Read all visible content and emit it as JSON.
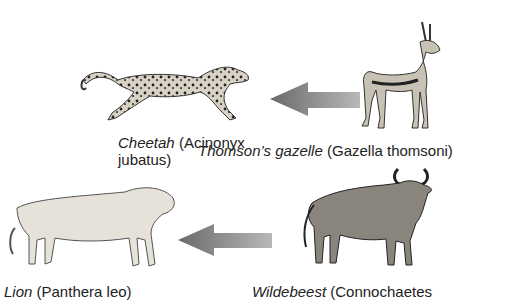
{
  "diagram": {
    "type": "food-chain",
    "arrow_color": "#7a7a7a",
    "rows": [
      {
        "predator": {
          "common": "Cheetah",
          "scientific_line1": "(Acinonyx",
          "scientific_line2": "jubatus)"
        },
        "prey": {
          "common": "Thomson’s gazelle",
          "scientific": "(Gazella thomsoni)"
        }
      },
      {
        "predator": {
          "common": "Lion",
          "scientific": "(Panthera leo)"
        },
        "prey": {
          "common": "Wildebeest",
          "scientific": "(Connochaetes"
        }
      }
    ]
  }
}
